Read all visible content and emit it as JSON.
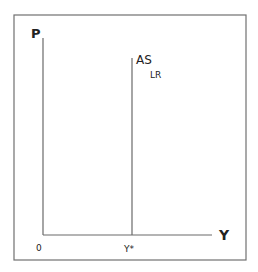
{
  "diagram": {
    "y_axis_label": "P",
    "x_axis_label": "Y",
    "origin_label": "0",
    "curve_label_main": "AS",
    "curve_label_sub": "LR",
    "x_tick_label": "Y*",
    "colors": {
      "line": "#6a6a6a",
      "frame": "#707070",
      "text": "#222222"
    }
  }
}
